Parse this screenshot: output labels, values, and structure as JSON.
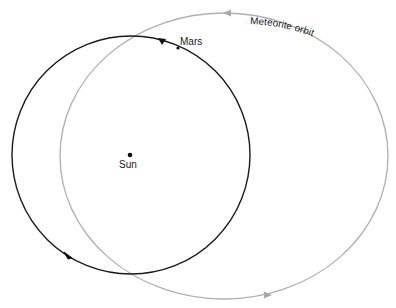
{
  "diagram": {
    "labels": {
      "sun": "Sun",
      "mars": "Mars",
      "meteorite_orbit": "Meteorite orbit"
    },
    "colors": {
      "mars_orbit": "#1a1a1a",
      "meteorite_orbit": "#b0b0b0",
      "background": "#ffffff"
    },
    "mars_orbit": {
      "cx": 131,
      "cy": 155,
      "r": 119
    },
    "meteorite_orbit": {
      "cx": 224,
      "cy": 156,
      "rx": 164,
      "ry": 143
    },
    "sun": {
      "x": 130,
      "y": 155
    },
    "mars_point": {
      "x": 178,
      "y": 48
    }
  }
}
